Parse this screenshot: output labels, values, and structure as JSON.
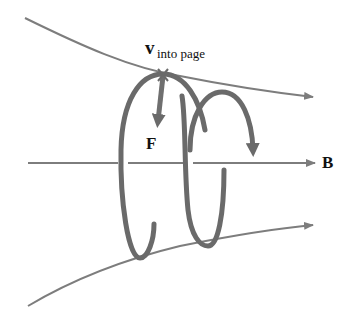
{
  "labels": {
    "velocity_symbol": "v",
    "velocity_subscript": "into page",
    "force": "F",
    "field": "B"
  },
  "colors": {
    "field_line": "#7d7d7d",
    "helix": "#6a6a6a",
    "force_arrow": "#6f6f6f",
    "text": "#111111",
    "background": "#ffffff"
  }
}
